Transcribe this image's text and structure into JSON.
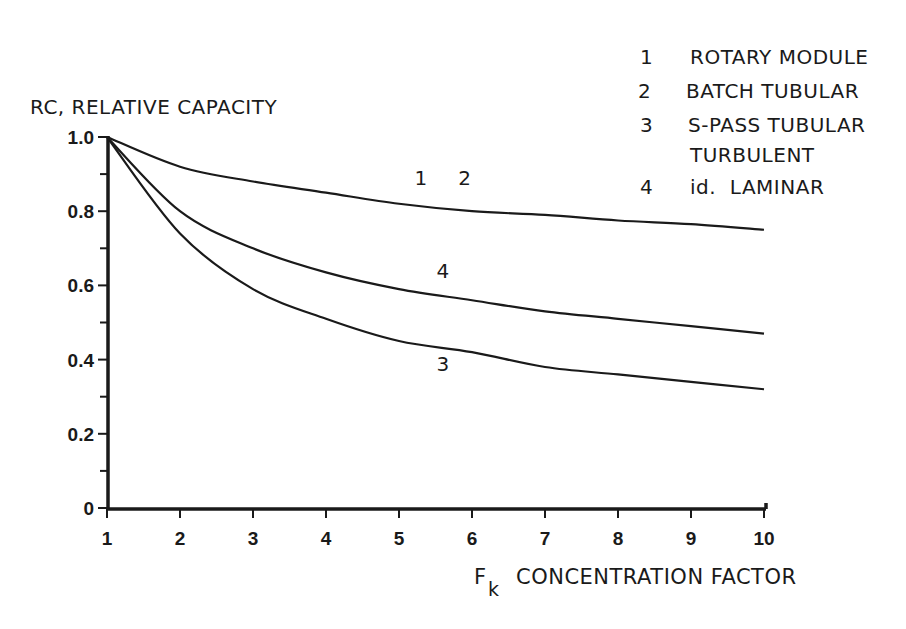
{
  "chart_data": {
    "type": "line",
    "title": "",
    "ylabel": "RC, RELATIVE CAPACITY",
    "xlabel": "F_k CONCENTRATION FACTOR",
    "xlabel_main": "F",
    "xlabel_sub": "k",
    "xlabel_rest": "CONCENTRATION FACTOR",
    "xlim": [
      1,
      10
    ],
    "ylim": [
      0,
      1.0
    ],
    "x_ticks": [
      "1",
      "2",
      "3",
      "4",
      "5",
      "6",
      "7",
      "8",
      "9",
      "10"
    ],
    "y_ticks": [
      "0",
      "0.2",
      "0.4",
      "0.6",
      "0.8",
      "1.0"
    ],
    "grid": false,
    "x": [
      1,
      2,
      3,
      4,
      5,
      6,
      7,
      8,
      9,
      10
    ],
    "series": [
      {
        "name": "1, 2 (ROTARY MODULE / BATCH TUBULAR)",
        "label": "1  2",
        "values": [
          1.0,
          0.92,
          0.88,
          0.85,
          0.82,
          0.8,
          0.79,
          0.775,
          0.765,
          0.75
        ]
      },
      {
        "name": "4 (id. LAMINAR)",
        "label": "4",
        "values": [
          1.0,
          0.8,
          0.7,
          0.635,
          0.59,
          0.56,
          0.53,
          0.51,
          0.49,
          0.47
        ]
      },
      {
        "name": "3 (S-PASS TUBULAR TURBULENT)",
        "label": "3",
        "values": [
          1.0,
          0.74,
          0.59,
          0.51,
          0.45,
          0.42,
          0.38,
          0.36,
          0.34,
          0.32
        ]
      }
    ],
    "legend": {
      "position": "top-right",
      "entries": [
        {
          "num": "1",
          "text": "ROTARY MODULE"
        },
        {
          "num": "2",
          "text": "BATCH TUBULAR"
        },
        {
          "num": "3",
          "text": "S-PASS TUBULAR"
        },
        {
          "num": "",
          "text": "TURBULENT"
        },
        {
          "num": "4",
          "text": "id.  LAMINAR"
        }
      ]
    },
    "annotations": [
      {
        "text": "1",
        "x": 5.3,
        "y": 0.87
      },
      {
        "text": "2",
        "x": 5.9,
        "y": 0.87
      },
      {
        "text": "4",
        "x": 5.6,
        "y": 0.62
      },
      {
        "text": "3",
        "x": 5.6,
        "y": 0.37
      }
    ]
  }
}
